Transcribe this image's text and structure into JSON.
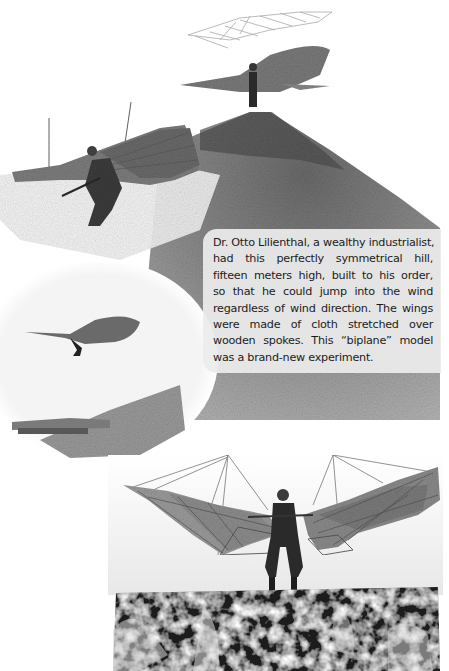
{
  "page": {
    "background": "#ffffff"
  },
  "photos": {
    "top_collage": {
      "description": "Collage of glider photographs around a conical hill",
      "elements": [
        "glider-wireframe-top",
        "glider-pilot-on-hilltop",
        "glider-pilot-mid-flight-left",
        "glider-distant-flight-circle-inset",
        "conical-hill"
      ]
    },
    "bottom_photo": {
      "description": "Pilot standing with biplane glider on rocky ledge"
    }
  },
  "caption": {
    "lines": [
      "Dr. Otto Lilienthal, a wealthy industrialist,",
      "had this perfectly symmetrical hill,",
      "fifteen meters high, built to his order,",
      "so that he could jump into the wind",
      "regardless of wind direction. The wings",
      "were made of cloth stretched over",
      "wooden spokes. This “biplane” model",
      "was a brand-new experiment."
    ]
  },
  "colors": {
    "hill_dark": "#5d5d5d",
    "hill_mid": "#8a8a8a",
    "caption_bg": "#ececec",
    "caption_text": "#1c1c1c"
  }
}
